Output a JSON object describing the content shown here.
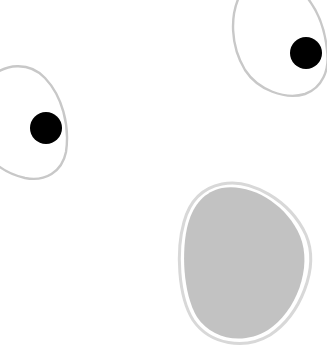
{
  "scene": {
    "title": "Cartoon surprised face",
    "background_color": "#ffffff",
    "outline_color": "#c8c8c8",
    "pupil_color": "#000000",
    "mouth_fill_color": "#c2c2c2",
    "mouth_rim_color": "#d8d8d8",
    "elements": [
      {
        "name": "left-eye",
        "description": "eye outline with pupil looking right"
      },
      {
        "name": "right-eye",
        "description": "eye outline with pupil looking right"
      },
      {
        "name": "mouth",
        "description": "open mouth, grey egg shape"
      }
    ]
  }
}
